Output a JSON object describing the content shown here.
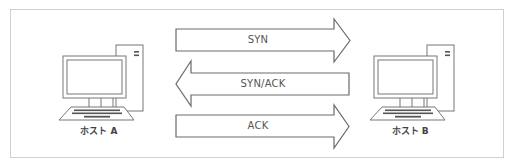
{
  "diagram": {
    "hosts": [
      {
        "label": "ホスト A",
        "icon": "desktop-computer-icon"
      },
      {
        "label": "ホスト B",
        "icon": "desktop-computer-icon"
      }
    ],
    "messages": [
      {
        "label": "SYN",
        "direction": "A→B"
      },
      {
        "label": "SYN/ACK",
        "direction": "B→A"
      },
      {
        "label": "ACK",
        "direction": "A→B"
      }
    ],
    "colors": {
      "stroke": "#6a6a6a",
      "frame": "#cfcfcf",
      "text": "#555555"
    }
  }
}
